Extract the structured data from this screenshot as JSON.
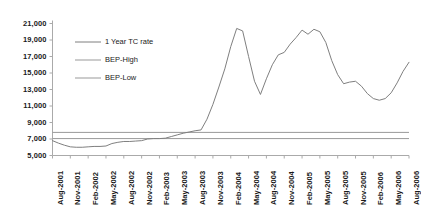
{
  "chart_data": {
    "type": "line",
    "title": "",
    "xlabel": "",
    "ylabel": "",
    "ylim": [
      5000,
      21000
    ],
    "ytick_step": 2000,
    "grid": false,
    "legend_position": "top-left-inside",
    "yticks": [
      "5,000",
      "7,000",
      "9,000",
      "11,000",
      "13,000",
      "15,000",
      "17,000",
      "19,000",
      "21,000"
    ],
    "ytick_values": [
      5000,
      7000,
      9000,
      11000,
      13000,
      15000,
      17000,
      19000,
      21000
    ],
    "categories": [
      "Aug-2001",
      "Sep-2001",
      "Oct-2001",
      "Nov-2001",
      "Dec-2001",
      "Jan-2002",
      "Feb-2002",
      "Mar-2002",
      "Apr-2002",
      "May-2002",
      "Jun-2002",
      "Jul-2002",
      "Aug-2002",
      "Sep-2002",
      "Oct-2002",
      "Nov-2002",
      "Dec-2002",
      "Jan-2003",
      "Feb-2003",
      "Mar-2003",
      "Apr-2003",
      "May-2003",
      "Jun-2003",
      "Jul-2003",
      "Aug-2003",
      "Sep-2003",
      "Oct-2003",
      "Nov-2003",
      "Dec-2003",
      "Jan-2004",
      "Feb-2004",
      "Mar-2004",
      "Apr-2004",
      "May-2004",
      "Jun-2004",
      "Jul-2004",
      "Aug-2004",
      "Sep-2004",
      "Oct-2004",
      "Nov-2004",
      "Dec-2004",
      "Jan-2005",
      "Feb-2005",
      "Mar-2005",
      "Apr-2005",
      "May-2005",
      "Jun-2005",
      "Jul-2005",
      "Aug-2005",
      "Sep-2005",
      "Oct-2005",
      "Nov-2005",
      "Dec-2005",
      "Jan-2006",
      "Feb-2006",
      "Mar-2006",
      "Apr-2006",
      "May-2006",
      "Jun-2006",
      "Jul-2006",
      "Aug-2006"
    ],
    "xtick_labels": [
      "Aug-2001",
      "Nov-2001",
      "Feb-2002",
      "May-2002",
      "Aug-2002",
      "Nov-2002",
      "Feb-2003",
      "May-2003",
      "Aug-2003",
      "Nov-2003",
      "Feb-2004",
      "May-2004",
      "Aug-2004",
      "Nov-2004",
      "Feb-2005",
      "May-2005",
      "Aug-2005",
      "Nov-2005",
      "Feb-2006",
      "May-2006",
      "Aug-2006"
    ],
    "series": [
      {
        "name": "1 Year TC rate",
        "color": "#7f7f7f",
        "values": [
          6800,
          6500,
          6250,
          6050,
          6000,
          6000,
          6050,
          6100,
          6100,
          6150,
          6450,
          6600,
          6700,
          6700,
          6750,
          6800,
          7000,
          7050,
          7050,
          7100,
          7300,
          7500,
          7700,
          7850,
          8000,
          8100,
          9400,
          11200,
          13300,
          15500,
          18200,
          20400,
          20100,
          17000,
          14000,
          12400,
          14300,
          16000,
          17200,
          17500,
          18500,
          19300,
          20200,
          19700,
          20300,
          20000,
          18700,
          16500,
          14800,
          13700,
          13900,
          14000,
          13400,
          12500,
          11900,
          11700,
          11900,
          12600,
          13800,
          15200,
          16300
        ]
      },
      {
        "name": "BEP-High",
        "color": "#999999",
        "constant": 7800
      },
      {
        "name": "BEP-Low",
        "color": "#999999",
        "constant": 7050
      }
    ],
    "legend": [
      {
        "label": "1 Year TC rate",
        "color": "#7f7f7f"
      },
      {
        "label": "BEP-High",
        "color": "#999999"
      },
      {
        "label": "BEP-Low",
        "color": "#999999"
      }
    ]
  }
}
